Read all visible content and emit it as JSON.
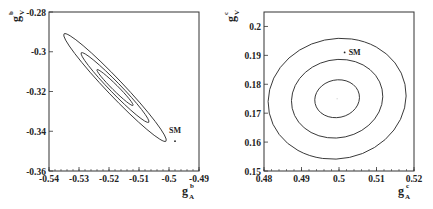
{
  "chart_data": [
    {
      "type": "scatter",
      "title": "",
      "xlabel": "g_A^b",
      "ylabel": "g_V^b",
      "xlim": [
        -0.54,
        -0.49
      ],
      "ylim": [
        -0.36,
        -0.28
      ],
      "xticks": [
        "-0.54",
        "-0.53",
        "-0.52",
        "-0.51",
        "-0.5",
        "-0.49"
      ],
      "yticks": [
        "-0.28",
        "-0.3",
        "-0.32",
        "-0.34",
        "-0.36"
      ],
      "grid": false,
      "contours": [
        {
          "level": "inner",
          "center": [
            -0.518,
            -0.318
          ],
          "x_range": [
            -0.5225,
            -0.5105
          ],
          "y_range": [
            -0.309,
            -0.327
          ]
        },
        {
          "level": "middle",
          "center": [
            -0.518,
            -0.318
          ],
          "x_range": [
            -0.527,
            -0.5045
          ],
          "y_range": [
            -0.302,
            -0.337
          ]
        },
        {
          "level": "outer",
          "center": [
            -0.518,
            -0.318
          ],
          "x_range": [
            -0.531,
            -0.497
          ],
          "y_range": [
            -0.294,
            -0.348
          ]
        }
      ],
      "annotations": [
        {
          "text": "SM",
          "x": -0.498,
          "y": -0.345
        }
      ]
    },
    {
      "type": "scatter",
      "title": "",
      "xlabel": "g_A^c",
      "ylabel": "g_V^c",
      "xlim": [
        0.48,
        0.52
      ],
      "ylim": [
        0.15,
        0.205
      ],
      "xticks": [
        "0.48",
        "0.49",
        "0.5",
        "0.51",
        "0.52"
      ],
      "yticks": [
        "0.2",
        "0.19",
        "0.18",
        "0.17",
        "0.16",
        "0.15"
      ],
      "grid": false,
      "contours": [
        {
          "level": "inner",
          "center": [
            0.4995,
            0.175
          ],
          "x_range": [
            0.4935,
            0.5055
          ],
          "y_range": [
            0.169,
            0.182
          ]
        },
        {
          "level": "middle",
          "center": [
            0.4995,
            0.175
          ],
          "x_range": [
            0.487,
            0.5115
          ],
          "y_range": [
            0.162,
            0.189
          ]
        },
        {
          "level": "outer",
          "center": [
            0.4995,
            0.175
          ],
          "x_range": [
            0.481,
            0.518
          ],
          "y_range": [
            0.155,
            0.1965
          ]
        }
      ],
      "annotations": [
        {
          "text": "SM",
          "x": 0.5015,
          "y": 0.191
        }
      ]
    }
  ],
  "labels": {
    "left": {
      "xlabel_main": "g",
      "xlabel_sub": "A",
      "xlabel_sup": "b",
      "ylabel_main": "g",
      "ylabel_sub": "V",
      "ylabel_sup": "b",
      "sm": "SM"
    },
    "right": {
      "xlabel_main": "g",
      "xlabel_sub": "A",
      "xlabel_sup": "c",
      "ylabel_main": "g",
      "ylabel_sub": "V",
      "ylabel_sup": "c",
      "sm": "SM"
    }
  }
}
